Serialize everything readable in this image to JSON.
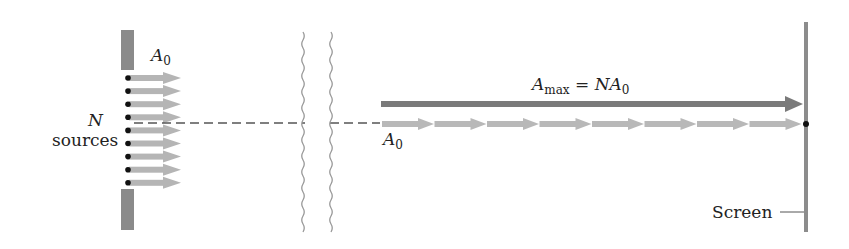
{
  "labels": {
    "a0_top": {
      "base": "A",
      "sub": "0"
    },
    "n_label": "N",
    "sources_label": "sources",
    "amax": {
      "base": "A",
      "sub": "max",
      "eq": " = ",
      "rhs_n": "N",
      "rhs_base": "A",
      "rhs_sub": "0"
    },
    "a0_bottom": {
      "base": "A",
      "sub": "0"
    },
    "screen_label": "Screen"
  },
  "diagram": {
    "source_count_drawn": 9,
    "colors": {
      "barrier": "#8a8a8a",
      "source_arrow": "#b5b5b5",
      "max_arrow": "#7a7a7a",
      "chain_arrow": "#b8b8b8",
      "screen": "#8c8c8c",
      "dashed_axis": "#555555",
      "dot": "#111111",
      "break_line": "#999999"
    }
  }
}
